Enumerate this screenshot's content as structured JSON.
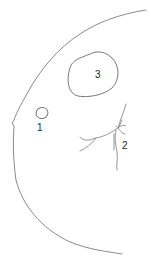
{
  "diagram": {
    "type": "anatomical line drawing",
    "colors": {
      "stroke": "#8a8a8a",
      "label": "#222222",
      "background": "#ffffff"
    },
    "labels": [
      {
        "id": "1",
        "text": "1",
        "x": 39,
        "y": 122,
        "description": "small oval region"
      },
      {
        "id": "2",
        "text": "2",
        "x": 124,
        "y": 140,
        "description": "branching stellate region"
      },
      {
        "id": "3",
        "text": "3",
        "x": 95,
        "y": 69,
        "description": "large irregular blob region"
      }
    ]
  }
}
